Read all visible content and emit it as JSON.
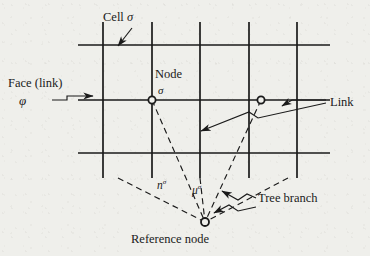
{
  "figure": {
    "kind": "technical-line-diagram",
    "background_color": "#efefeb",
    "ink_color": "#1a1a1a"
  },
  "labels": {
    "cell": "Cell",
    "cell_symbol": "σ",
    "face": "Face (link)",
    "face_symbol": "φ",
    "node": "Node",
    "node_symbol": "σ",
    "link": "Link",
    "n_symbol": "n",
    "n_superscript": "σ",
    "mu_symbol": "μ",
    "mu_superscript": "σ",
    "tree_branch": "Tree branch",
    "reference_node": "Reference node"
  },
  "mesh": {
    "vertical_lines_x": [
      103,
      152,
      200,
      249,
      297
    ],
    "vertical_line_top": 22,
    "vertical_line_bottom": 178,
    "horizontal_lines_y": [
      45,
      100,
      153
    ],
    "horizontal_line_left": 78,
    "horizontal_line_right": 330,
    "line_width": 1.7
  },
  "nodes": [
    {
      "name": "node-sigma",
      "x": 152,
      "y": 100,
      "radius": 3.6
    },
    {
      "name": "node-right",
      "x": 261,
      "y": 100,
      "radius": 3.6
    },
    {
      "name": "reference-node",
      "x": 205,
      "y": 222,
      "radius": 4.0
    }
  ],
  "tree_branches": [
    {
      "from_x": 152,
      "from_y": 100,
      "to_x": 205,
      "to_y": 222
    },
    {
      "from_x": 261,
      "from_y": 100,
      "to_x": 205,
      "to_y": 222
    },
    {
      "from_x": 118,
      "from_y": 178,
      "to_x": 205,
      "to_y": 222
    },
    {
      "from_x": 200,
      "from_y": 178,
      "to_x": 205,
      "to_y": 222
    },
    {
      "from_x": 288,
      "from_y": 178,
      "to_x": 205,
      "to_y": 222
    }
  ],
  "leaders": [
    {
      "name": "cell-leader",
      "points": "132,28 118,46",
      "arrow_at_end": true
    },
    {
      "name": "face-leader",
      "points": "52,100 67,100 67,96 93,96",
      "arrow_at_end": true
    },
    {
      "name": "link-leader-a",
      "points": "326,100 292,100 282,106",
      "arrow_at_end": true
    },
    {
      "name": "link-leader-b",
      "points": "326,103 258,118 249,112 201,131",
      "arrow_at_end": true
    },
    {
      "name": "tree-leader-a",
      "points": "256,198 247,194 238,200 222,191",
      "arrow_at_end": true
    },
    {
      "name": "tree-leader-b",
      "points": "256,207 238,211 229,205 214,213",
      "arrow_at_end": true
    }
  ]
}
